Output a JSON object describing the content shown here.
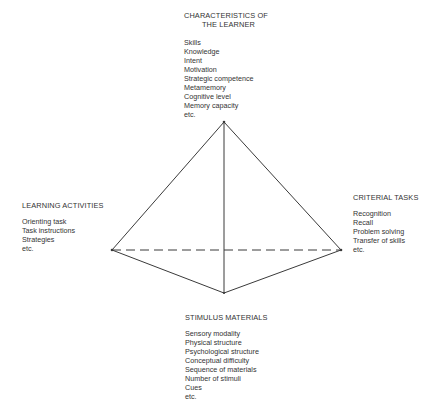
{
  "diagram": {
    "type": "tetrahedral-model",
    "vertices": {
      "top": {
        "title_line1": "CHARACTERISTICS OF",
        "title_line2": "THE LEARNER",
        "items": [
          "Skills",
          "Knowledge",
          "Intent",
          "Motivation",
          "Strategic competence",
          "Metamemory",
          "Cognitive level",
          "Memory capacity",
          "etc."
        ]
      },
      "left": {
        "title": "LEARNING ACTIVITIES",
        "items": [
          "Orienting task",
          "Task instructions",
          "Strategies",
          "etc."
        ]
      },
      "right": {
        "title": "CRITERIAL TASKS",
        "items": [
          "Recognition",
          "Recall",
          "Problem solving",
          "Transfer of skills",
          "etc."
        ]
      },
      "bottom": {
        "title": "STIMULUS MATERIALS",
        "items": [
          "Sensory modality",
          "Physical structure",
          "Psychological structure",
          "Conceptual difficulty",
          "Sequence of materials",
          "Number of stimuli",
          "Cues",
          "etc."
        ]
      }
    },
    "colors": {
      "line": "#3a3a3a",
      "text": "#333333",
      "background": "#ffffff"
    }
  }
}
